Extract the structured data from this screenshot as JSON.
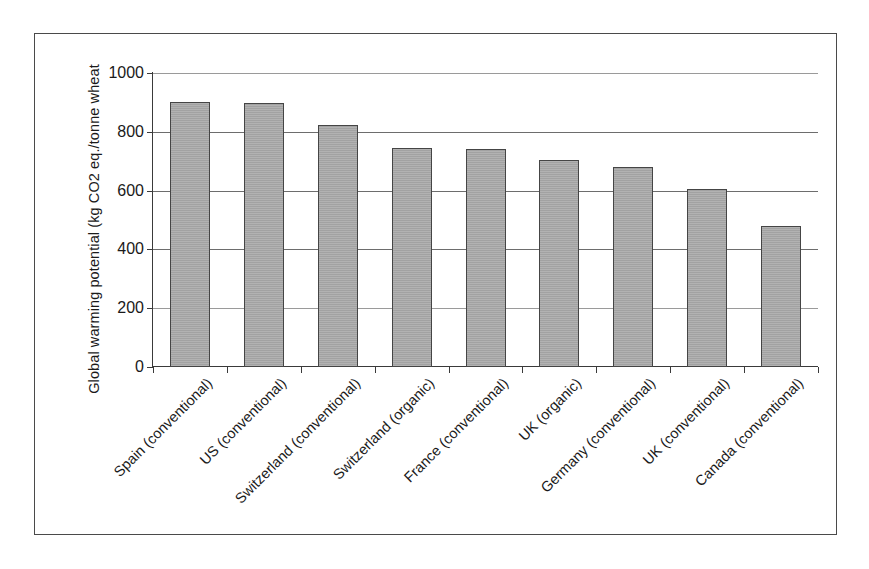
{
  "figure": {
    "background_color": "#ffffff",
    "frame_color": "#4a4a4a",
    "bar_fill_color": "#a9a9a9",
    "bar_edge_color": "#454545",
    "grid_color": "#6d6d6d"
  },
  "chart_data": {
    "type": "bar",
    "title": "",
    "xlabel": "",
    "ylabel": "Global warming potential (kg CO2 eq./tonne wheat",
    "ylim": [
      0,
      1000
    ],
    "yticks": [
      0,
      200,
      400,
      600,
      800,
      1000
    ],
    "ytick_labels": [
      "0",
      "200",
      "400",
      "600",
      "800",
      "1000"
    ],
    "grid": true,
    "grid_axis": "y",
    "legend": false,
    "legend_position": "none",
    "categories": [
      "Spain (conventional)",
      "US (conventional)",
      "Switzerland (conventional)",
      "Switzerland (organic)",
      "France (conventional)",
      "UK (organic)",
      "Germany (conventional)",
      "UK (conventional)",
      "Canada (conventional)"
    ],
    "values": [
      900,
      898,
      824,
      746,
      742,
      703,
      681,
      607,
      478
    ],
    "units": "kg CO2 eq./tonne wheat"
  }
}
